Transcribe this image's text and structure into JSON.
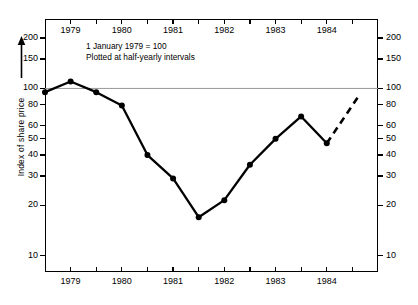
{
  "chart_data": {
    "type": "line",
    "title": "",
    "subtitle": "",
    "ylabel": "Index of share price",
    "xlabel": "",
    "yscale": "log",
    "ylim": [
      8,
      260
    ],
    "xlim": [
      1978.5,
      1985.0
    ],
    "grid": false,
    "legend": false,
    "reference_line": {
      "value": 100,
      "color": "#9a9a9a"
    },
    "annotations": [
      "1 January 1979 = 100",
      "Plotted at half-yearly intervals"
    ],
    "y_ticks": [
      10,
      20,
      30,
      40,
      50,
      60,
      80,
      100,
      150,
      200
    ],
    "y_tick_labels": [
      "10",
      "20",
      "30",
      "40",
      "50",
      "60",
      "80",
      "100",
      "150",
      "200"
    ],
    "y_axis_sides": [
      "left",
      "right"
    ],
    "x_ticks": [
      1979,
      1980,
      1981,
      1982,
      1983,
      1984
    ],
    "x_tick_labels": [
      "1979",
      "1980",
      "1981",
      "1982",
      "1983",
      "1984"
    ],
    "x_minor_ticks": [
      1978.5,
      1979,
      1979.5,
      1980,
      1980.5,
      1981,
      1981.5,
      1982,
      1982.5,
      1983,
      1983.5,
      1984,
      1984.5
    ],
    "x_axis_sides": [
      "top",
      "bottom"
    ],
    "series": [
      {
        "name": "Index of share price",
        "style": "solid",
        "marker": "circle",
        "color": "#000000",
        "x": [
          1978.5,
          1979.0,
          1979.5,
          1980.0,
          1980.5,
          1981.0,
          1981.5,
          1982.0,
          1982.5,
          1983.0,
          1983.5,
          1984.0
        ],
        "values": [
          95,
          110,
          95,
          79,
          40,
          29,
          17,
          21.5,
          35,
          50,
          68,
          47
        ]
      },
      {
        "name": "Projection",
        "style": "dashed",
        "marker": "none",
        "color": "#000000",
        "x": [
          1984.0,
          1984.6
        ],
        "values": [
          47,
          88
        ]
      }
    ]
  },
  "caption": {
    "text": ""
  }
}
